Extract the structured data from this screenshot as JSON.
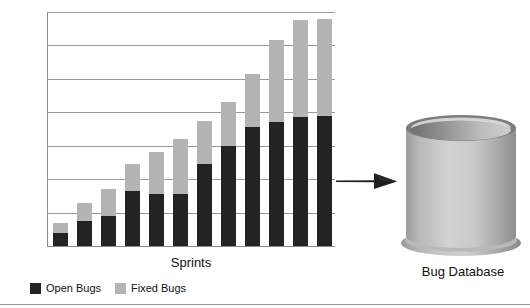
{
  "figure": {
    "database_label": "Bug Database",
    "arrow_icon": "arrow-right-icon",
    "database_icon": "database-cylinder-icon"
  },
  "chart_data": {
    "type": "bar",
    "subtype": "stacked",
    "title": "",
    "xlabel": "Sprints",
    "ylabel": "",
    "ylim": [
      0.0,
      70.0
    ],
    "ytick_labels": [
      "70.0",
      "60.0",
      "50.0",
      "40.0",
      "30.0",
      "20.0",
      "10.0",
      "0.0"
    ],
    "yticks": [
      70.0,
      60.0,
      50.0,
      40.0,
      30.0,
      20.0,
      10.0,
      0.0
    ],
    "grid": true,
    "grid_axis": "y",
    "legend_position": "bottom-left",
    "categories": [
      "1",
      "2",
      "3",
      "4",
      "5",
      "6",
      "7",
      "8",
      "9",
      "10",
      "11",
      "12"
    ],
    "series": [
      {
        "name": "Open Bugs",
        "color": "#232323",
        "values": [
          4.0,
          7.5,
          9.0,
          16.5,
          15.5,
          15.5,
          24.5,
          30.0,
          35.5,
          37.0,
          38.5,
          39.0
        ]
      },
      {
        "name": "Fixed Bugs",
        "color": "#b4b4b4",
        "values": [
          3.0,
          5.5,
          8.0,
          8.0,
          12.5,
          16.5,
          13.0,
          13.0,
          16.0,
          24.5,
          29.0,
          29.0
        ]
      }
    ],
    "totals": [
      7.0,
      13.0,
      17.0,
      24.5,
      28.0,
      32.0,
      37.5,
      43.0,
      51.5,
      61.5,
      67.5,
      68.0
    ]
  },
  "colors": {
    "open_bugs": "#232323",
    "fixed_bugs": "#b4b4b4",
    "gridline": "#9a9a9a",
    "arrow": "#1f1f1f",
    "cylinder_light": "#d8d8d8",
    "cylinder_dark": "#8e8e8e"
  }
}
